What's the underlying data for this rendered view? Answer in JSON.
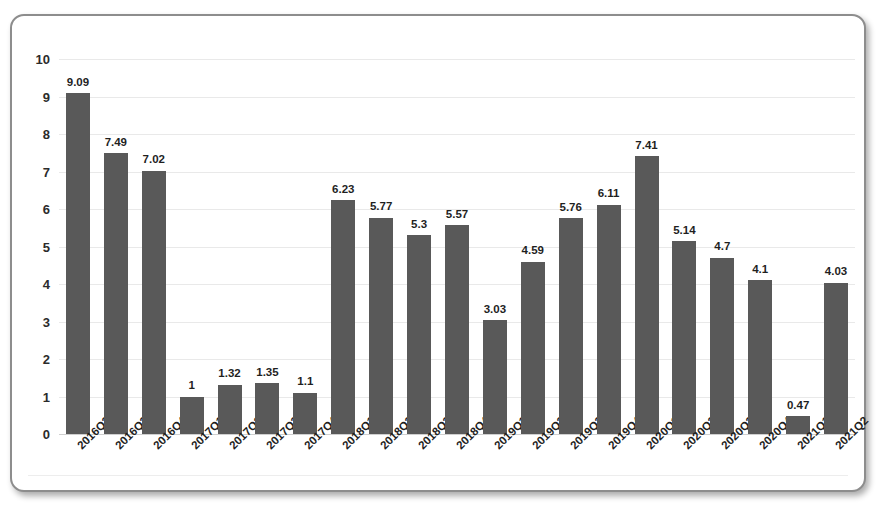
{
  "chart_data": {
    "type": "bar",
    "title": "",
    "subtitle": "",
    "xlabel": "",
    "ylabel": "",
    "ylim": [
      0,
      10
    ],
    "ytick_step": 1,
    "grid": true,
    "legend": false,
    "bar_color": "#595959",
    "categories": [
      "2016Q2",
      "2016Q3",
      "2016Q4",
      "2017Q1",
      "2017Q2",
      "2017Q3",
      "2017Q4",
      "2018Q1",
      "2018Q2",
      "2018Q3",
      "2018Q4",
      "2019Q1",
      "2019Q2",
      "2019Q3",
      "2019Q4",
      "2020Q1",
      "2020Q2",
      "2020Q3",
      "2020Q4",
      "2021Q1",
      "2021Q2"
    ],
    "values": [
      9.09,
      7.49,
      7.02,
      1,
      1.32,
      1.35,
      1.1,
      6.23,
      5.77,
      5.3,
      5.57,
      3.03,
      4.59,
      5.76,
      6.11,
      7.41,
      5.14,
      4.7,
      4.1,
      0.47,
      4.03
    ],
    "value_labels": [
      "9.09",
      "7.49",
      "7.02",
      "1",
      "1.32",
      "1.35",
      "1.1",
      "6.23",
      "5.77",
      "5.3",
      "5.57",
      "3.03",
      "4.59",
      "5.76",
      "6.11",
      "7.41",
      "5.14",
      "4.7",
      "4.1",
      "0.47",
      "4.03"
    ],
    "ytick_labels": [
      "0",
      "1",
      "2",
      "3",
      "4",
      "5",
      "6",
      "7",
      "8",
      "9",
      "10"
    ]
  }
}
